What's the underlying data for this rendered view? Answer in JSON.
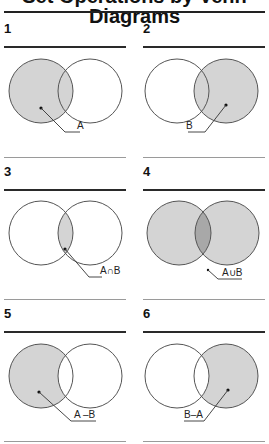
{
  "title": "Set Operations by Venn Diagrams",
  "colors": {
    "shade": "#d4d4d4",
    "shade_overlap": "#a8a8a8",
    "outline": "#555555",
    "rule": "#222222",
    "thin_rule": "#9a9a9a"
  },
  "panels": [
    {
      "number": "1",
      "label": "A",
      "shaded": "A"
    },
    {
      "number": "2",
      "label": "B",
      "shaded": "B"
    },
    {
      "number": "3",
      "label": "A∩B",
      "shaded": "intersection"
    },
    {
      "number": "4",
      "label": "A∪B",
      "shaded": "union"
    },
    {
      "number": "5",
      "label": "A –B",
      "shaded": "A minus B"
    },
    {
      "number": "6",
      "label": "B–A",
      "shaded": "B minus A"
    }
  ]
}
